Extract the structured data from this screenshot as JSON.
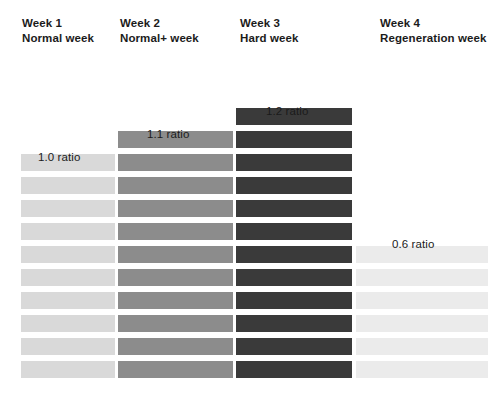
{
  "chart_data": {
    "type": "bar",
    "title": "",
    "subtitle": "",
    "xlabel": "",
    "ylabel": "",
    "orientation": "vertical-stacked-blocks",
    "grid": false,
    "legend": "none",
    "categories": [
      "Week 1",
      "Week 2",
      "Week 3",
      "Week 4"
    ],
    "category_subtitles": [
      "Normal week",
      "Normal+ week",
      "Hard week",
      "Regeneration week"
    ],
    "values": [
      10,
      11,
      12,
      6
    ],
    "value_labels": [
      "1.0 ratio",
      "1.1 ratio",
      "1.2 ratio",
      "0.6 ratio"
    ],
    "ratios": [
      1.0,
      1.1,
      1.2,
      0.6
    ],
    "unit": "blocks",
    "series": [
      {
        "name": "Training load",
        "values": [
          10,
          11,
          12,
          6
        ]
      }
    ],
    "colors": [
      "#d9d9d9",
      "#8c8c8c",
      "#3a3a3a",
      "#ebebeb"
    ]
  },
  "columns": [
    {
      "id": "week-1",
      "title": "Week 1",
      "subtitle": "Normal week",
      "ratio_label": "1.0 ratio",
      "blocks": 10,
      "color": "#d9d9d9",
      "header_left": 22,
      "header_top": 16,
      "bar_left": 21,
      "bar_width": 94,
      "label_left": 38,
      "label_top": 151
    },
    {
      "id": "week-2",
      "title": "Week 2",
      "subtitle": "Normal+ week",
      "ratio_label": "1.1 ratio",
      "blocks": 11,
      "color": "#8c8c8c",
      "header_left": 120,
      "header_top": 16,
      "bar_left": 118,
      "bar_width": 115,
      "label_left": 147,
      "label_top": 128
    },
    {
      "id": "week-3",
      "title": "Week 3",
      "subtitle": "Hard week",
      "ratio_label": "1.2 ratio",
      "blocks": 12,
      "color": "#3a3a3a",
      "header_left": 240,
      "header_top": 16,
      "bar_left": 236,
      "bar_width": 116,
      "label_left": 266,
      "label_top": 105
    },
    {
      "id": "week-4",
      "title": "Week 4",
      "subtitle": "Regeneration week",
      "ratio_label": "0.6 ratio",
      "blocks": 6,
      "color": "#ebebeb",
      "header_left": 380,
      "header_top": 16,
      "bar_left": 356,
      "bar_width": 132,
      "label_left": 392,
      "label_top": 238
    }
  ]
}
